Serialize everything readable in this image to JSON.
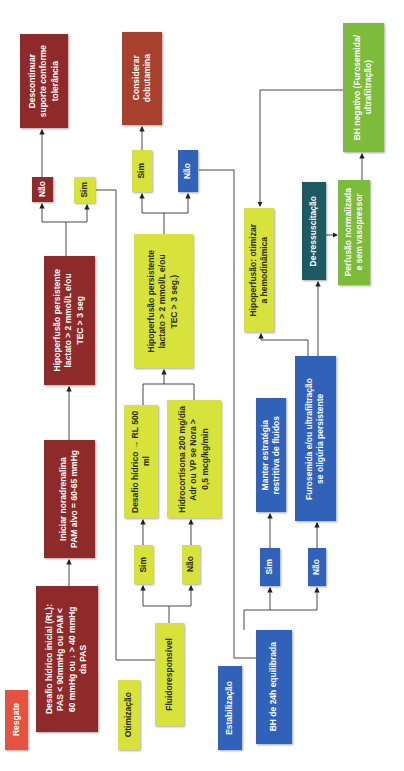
{
  "diagram": {
    "orientation": "rotated 90 degrees counter-clockwise",
    "colors": {
      "resgate": "#8e2a2a",
      "resgate_label": "#e5523f",
      "dobutamina": "#a8412d",
      "otimizacao": "#d7e33a",
      "estabilizacao": "#2f62b8",
      "de_ressuscitacao_label": "#1d5a63",
      "de_ressuscitacao": "#7dbb3a",
      "connector": "#333333"
    },
    "phases": {
      "resgate": {
        "label": "Resgate",
        "desafio": "Desafio hídrico inicial (RL):\nPAS < 90mmHg ou PAM <\n60 mmHg ou ↓ > 40 mmHg\nda PAS",
        "noradrenalina": "Iniciar noradrenalina\nPAM alvo = 60-65 mmHg",
        "hipoperfusao": "Hipoperfusão persistente\nlactato > 2 mmol/L e/ou\nTEC > 3 seg",
        "nao": "Não",
        "sim": "Sim",
        "descontinuar": "Descontinuar\nsuporte conforme\ntolerância"
      },
      "otimizacao": {
        "label": "Otimização",
        "fluidoresponsivel": "Fluidoresponsível",
        "sim": "Sim",
        "nao": "Não",
        "desafio": "Desafio hídrico → RL 500 ml",
        "hidrocortisona": "Hidrocortisona 200 mg/dia\nAdr ou VP se Nora >\n0,5 mcg/kg/min",
        "hipoperfusao": "Hipoperfusão persistente\nlactato > 2 mmol/L e/ou\nTEC > 3 seg.)",
        "sim2": "Sim",
        "nao2": "Não",
        "dobutamina": "Considerar\ndobutamina"
      },
      "estabilizacao": {
        "label": "Estabilização",
        "bh24h": "BH de 24h equilibrada",
        "sim": "Sim",
        "nao": "Não",
        "manter": "Manter estratégia\nrestritiva de fluidos",
        "furosemida": "Furosemida e/ou ultrafiltração\nse oligúria persistente",
        "hipoperfusao": "Hipoperfusão: otimizar\na hemodinâmica"
      },
      "de_ressuscitacao": {
        "label": "De-ressuscitação",
        "perfusao": "Perfusão normalizada\ne sem vasopressor",
        "bh_negativo": "BH negativo (Furosemida/\nultrafiltração)"
      }
    }
  }
}
